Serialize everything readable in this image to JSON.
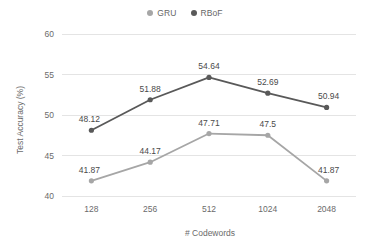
{
  "chart_data": {
    "type": "line",
    "title": "",
    "xlabel": "# Codewords",
    "ylabel": "Test Accuracy (%)",
    "categories": [
      "128",
      "256",
      "512",
      "1024",
      "2048"
    ],
    "ylim": [
      40,
      60
    ],
    "yticks": [
      "40",
      "45",
      "50",
      "55",
      "60"
    ],
    "grid": true,
    "legend_position": "top-center",
    "series": [
      {
        "name": "GRU",
        "color": "#a6a6a6",
        "values": [
          41.87,
          44.17,
          47.71,
          47.5,
          41.87
        ],
        "labels": [
          "41.87",
          "44.17",
          "47.71",
          "47.5",
          "41.87"
        ]
      },
      {
        "name": "RBoF",
        "color": "#595959",
        "values": [
          48.12,
          51.88,
          54.64,
          52.69,
          50.94
        ],
        "labels": [
          "48.12",
          "51.88",
          "54.64",
          "52.69",
          "50.94"
        ]
      }
    ]
  },
  "legend": {
    "entries": [
      {
        "label": "GRU",
        "marker": "legend-dot-gru"
      },
      {
        "label": "RBoF",
        "marker": "legend-dot-rbof"
      }
    ]
  },
  "axes": {
    "y_title": "Test Accuracy (%)",
    "x_title": "# Codewords"
  },
  "colors": {
    "gru": "#a6a6a6",
    "rbof": "#595959",
    "grid": "#e4e4e4",
    "text": "#6b6b6b",
    "label_text": "#4a4a4a",
    "background": "#ffffff"
  }
}
